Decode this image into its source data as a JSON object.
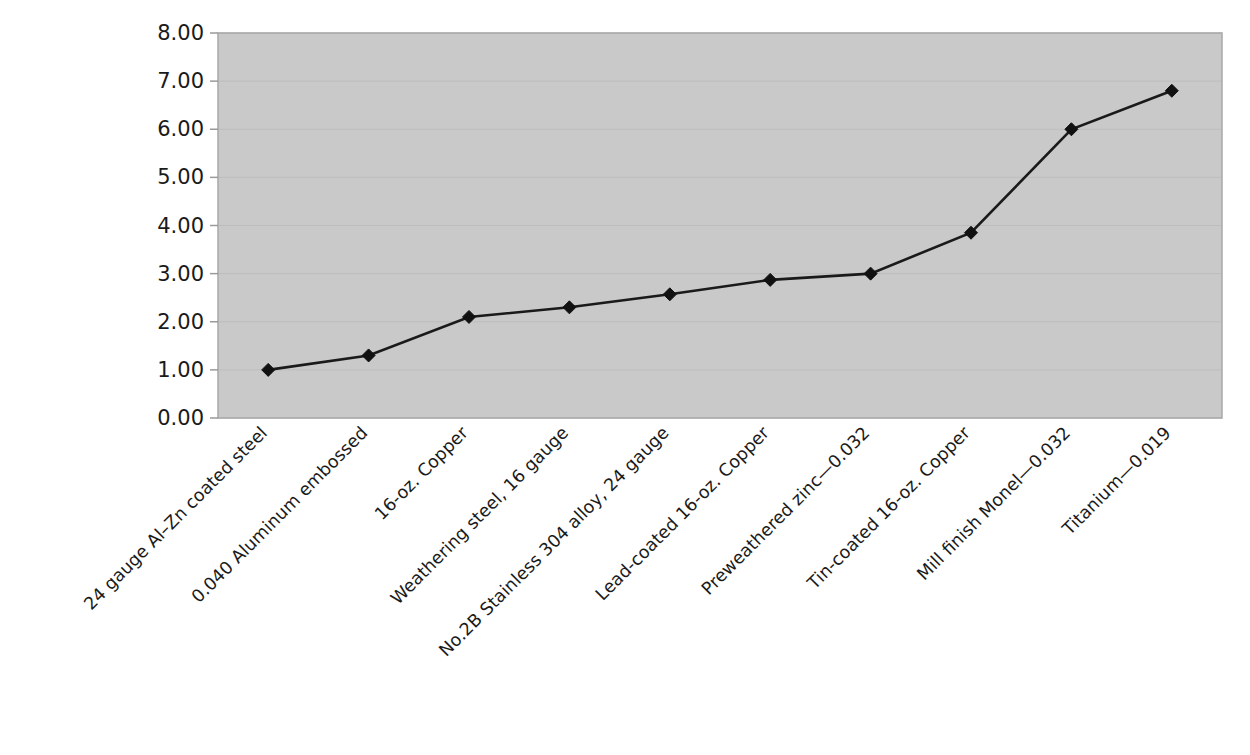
{
  "chart_data": {
    "type": "line",
    "title": "",
    "subtitle": "",
    "xlabel": "",
    "ylabel": "",
    "grid": true,
    "legend": false,
    "legend_position": "none",
    "ylim": [
      0,
      8
    ],
    "ytick_step": 1,
    "ytick_labels": [
      "8.00",
      "7.00",
      "6.00",
      "5.00",
      "4.00",
      "3.00",
      "2.00",
      "1.00",
      "0.00"
    ],
    "ytick_values": [
      8,
      7,
      6,
      5,
      4,
      3,
      2,
      1,
      0
    ],
    "categories": [
      "24 gauge Al–Zn coated steel",
      "0.040 Aluminum embossed",
      "16-oz. Copper",
      "Weathering steel, 16 gauge",
      "No.2B Stainless 304 alloy, 24 gauge",
      "Lead-coated 16-oz. Copper",
      "Preweathered zinc—0.032",
      "Tin-coated 16-oz. Copper",
      "Mill finish Monel—0.032",
      "Titanium—0.019"
    ],
    "values": [
      1.0,
      1.3,
      2.1,
      2.3,
      2.57,
      2.87,
      3.0,
      3.85,
      6.0,
      6.8
    ],
    "series": [
      {
        "name": "Relative cost",
        "values": [
          1.0,
          1.3,
          2.1,
          2.3,
          2.57,
          2.87,
          3.0,
          3.85,
          6.0,
          6.8
        ],
        "marker": "diamond",
        "line_color": "#1a1a1a",
        "marker_color": "#111111"
      }
    ],
    "xtick_rotation_deg": -45,
    "plot_background_color": "#c9c9c9",
    "page_background_color": "#ffffff",
    "axis_text_color": "#1a1a1a"
  }
}
